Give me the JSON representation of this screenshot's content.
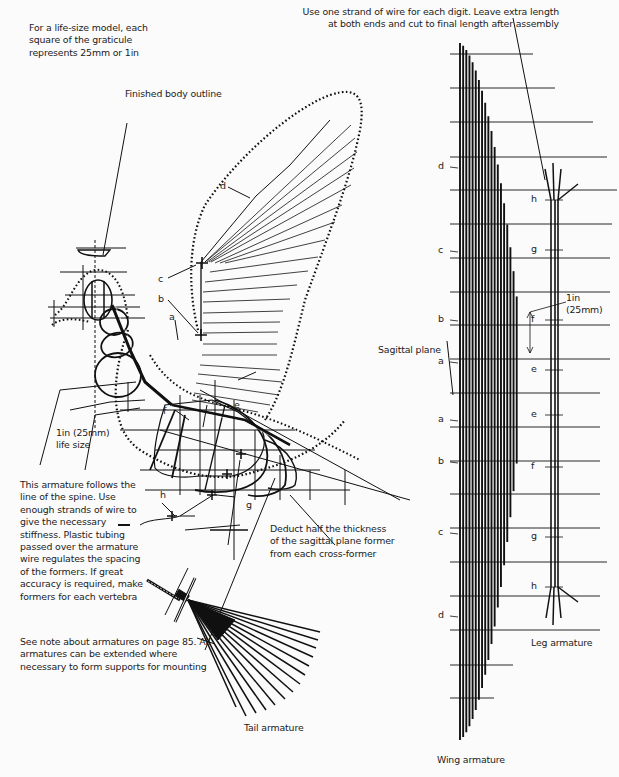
{
  "notes": {
    "graticule": "For a life-size model, each\nsquare of the graticule\nrepresents 25mm or 1in",
    "body_outline": "Finished body outline",
    "wire_strand": "Use one strand of wire for each digit. Leave extra length\nat both ends and cut to final length after assembly",
    "scale": "1in (25mm)\nlife size",
    "spine": "This armature follows the\nline of the spine. Use\nenough strands of wire to\ngive the necessary\nstiffness. Plastic tubing\npassed over the armature\nwire regulates the spacing\nof the formers. If great\naccuracy is required, make\nformers for each vertebra",
    "sagittal_deduct": "Deduct half the thickness\nof the sagittal plane former\nfrom each cross-former",
    "armature_note": "See note about armatures on page 85. All\narmatures can be extended where\nnecessary to form supports for mounting",
    "sagittal_plane": "Sagittal plane",
    "leg_scale": "1in\n(25mm)"
  },
  "captions": {
    "tail": "Tail armature",
    "wing": "Wing armature",
    "leg": "Leg armature"
  },
  "body_labels": {
    "a": "a",
    "b": "b",
    "c": "c",
    "d": "d",
    "e": "e",
    "f": "f",
    "g": "g",
    "h": "h"
  },
  "wing_labels": [
    {
      "key": "d",
      "y": 167
    },
    {
      "key": "c",
      "y": 251
    },
    {
      "key": "b",
      "y": 320
    },
    {
      "key": "a",
      "y": 362
    },
    {
      "key": "a",
      "y": 420
    },
    {
      "key": "b",
      "y": 462
    },
    {
      "key": "c",
      "y": 533
    },
    {
      "key": "d",
      "y": 616
    }
  ],
  "leg_labels": [
    {
      "key": "h",
      "y": 200
    },
    {
      "key": "g",
      "y": 250
    },
    {
      "key": "f",
      "y": 320
    },
    {
      "key": "e",
      "y": 370
    },
    {
      "key": "e",
      "y": 415
    },
    {
      "key": "f",
      "y": 467
    },
    {
      "key": "g",
      "y": 537
    },
    {
      "key": "h",
      "y": 587
    }
  ],
  "colors": {
    "ink": "#111111",
    "paper": "#fbfbfb"
  }
}
